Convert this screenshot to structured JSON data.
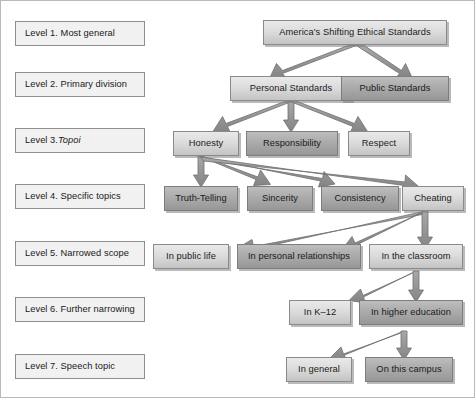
{
  "diagram": {
    "title_text": "America's Shifting Ethical Standards",
    "levels": [
      {
        "id": "level-1",
        "label_prefix": "Level 1. Most general",
        "label_italic": ""
      },
      {
        "id": "level-2",
        "label_prefix": "Level 2. Primary division",
        "label_italic": ""
      },
      {
        "id": "level-3",
        "label_prefix": "Level 3. ",
        "label_italic": "Topoi"
      },
      {
        "id": "level-4",
        "label_prefix": "Level 4. Specific topics",
        "label_italic": ""
      },
      {
        "id": "level-5",
        "label_prefix": "Level 5. Narrowed scope",
        "label_italic": ""
      },
      {
        "id": "level-6",
        "label_prefix": "Level 6. Further narrowing",
        "label_italic": ""
      },
      {
        "id": "level-7",
        "label_prefix": "Level 7. Speech topic",
        "label_italic": ""
      }
    ],
    "nodes": [
      {
        "id": "n-americas-shifting-ethical-standards",
        "text": "America's Shifting Ethical Standards",
        "level": 1,
        "shade": "light"
      },
      {
        "id": "n-personal-standards",
        "text": "Personal Standards",
        "level": 2,
        "shade": "light"
      },
      {
        "id": "n-public-standards",
        "text": "Public Standards",
        "level": 2,
        "shade": "dark"
      },
      {
        "id": "n-honesty",
        "text": "Honesty",
        "level": 3,
        "shade": "light"
      },
      {
        "id": "n-responsibility",
        "text": "Responsibility",
        "level": 3,
        "shade": "dark"
      },
      {
        "id": "n-respect",
        "text": "Respect",
        "level": 3,
        "shade": "light"
      },
      {
        "id": "n-truth-telling",
        "text": "Truth-Telling",
        "level": 4,
        "shade": "dark"
      },
      {
        "id": "n-sincerity",
        "text": "Sincerity",
        "level": 4,
        "shade": "dark"
      },
      {
        "id": "n-consistency",
        "text": "Consistency",
        "level": 4,
        "shade": "dark"
      },
      {
        "id": "n-cheating",
        "text": "Cheating",
        "level": 4,
        "shade": "light"
      },
      {
        "id": "n-in-public-life",
        "text": "In public life",
        "level": 5,
        "shade": "light"
      },
      {
        "id": "n-in-personal-relationships",
        "text": "In personal relationships",
        "level": 5,
        "shade": "dark"
      },
      {
        "id": "n-in-the-classroom",
        "text": "In the classroom",
        "level": 5,
        "shade": "light"
      },
      {
        "id": "n-in-k-12",
        "text": "In K–12",
        "level": 6,
        "shade": "light"
      },
      {
        "id": "n-in-higher-education",
        "text": "In higher education",
        "level": 6,
        "shade": "dark"
      },
      {
        "id": "n-in-general",
        "text": "In general",
        "level": 7,
        "shade": "light"
      },
      {
        "id": "n-on-this-campus",
        "text": "On this campus",
        "level": 7,
        "shade": "dark"
      }
    ],
    "edges": [
      {
        "from": "n-americas-shifting-ethical-standards",
        "to": "n-personal-standards"
      },
      {
        "from": "n-americas-shifting-ethical-standards",
        "to": "n-public-standards"
      },
      {
        "from": "n-personal-standards",
        "to": "n-honesty"
      },
      {
        "from": "n-personal-standards",
        "to": "n-responsibility"
      },
      {
        "from": "n-personal-standards",
        "to": "n-respect"
      },
      {
        "from": "n-honesty",
        "to": "n-truth-telling"
      },
      {
        "from": "n-honesty",
        "to": "n-sincerity"
      },
      {
        "from": "n-honesty",
        "to": "n-consistency"
      },
      {
        "from": "n-honesty",
        "to": "n-cheating"
      },
      {
        "from": "n-cheating",
        "to": "n-in-public-life"
      },
      {
        "from": "n-cheating",
        "to": "n-in-personal-relationships"
      },
      {
        "from": "n-cheating",
        "to": "n-in-the-classroom"
      },
      {
        "from": "n-in-the-classroom",
        "to": "n-in-k-12"
      },
      {
        "from": "n-in-the-classroom",
        "to": "n-in-higher-education"
      },
      {
        "from": "n-in-higher-education",
        "to": "n-in-general"
      },
      {
        "from": "n-in-higher-education",
        "to": "n-on-this-campus"
      }
    ],
    "colors": {
      "arrow": "#8c8c8c",
      "arrow_outline": "#6f6f6f",
      "node_light": "#dcdcdc",
      "node_dark": "#ababab",
      "level_box": "#f1f1f1",
      "border": "#8b8b8b",
      "text": "#1a1a1a",
      "page_border": "#b9b9b9"
    }
  }
}
